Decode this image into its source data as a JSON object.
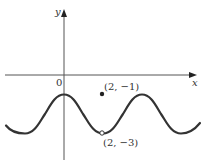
{
  "figure": {
    "type": "function-graph",
    "function": "y = -2 + cos(pi*x/2)",
    "axes": {
      "x_label": "x",
      "y_label": "y",
      "origin_label": "0"
    },
    "points": [
      {
        "label": "(2, −1)",
        "x": 2,
        "y": -1,
        "style": "filled"
      },
      {
        "label": "(2, −3)",
        "x": 2,
        "y": -3,
        "style": "open"
      }
    ],
    "colors": {
      "curve": "#333333",
      "axes": "#555555",
      "text": "#333333"
    }
  }
}
